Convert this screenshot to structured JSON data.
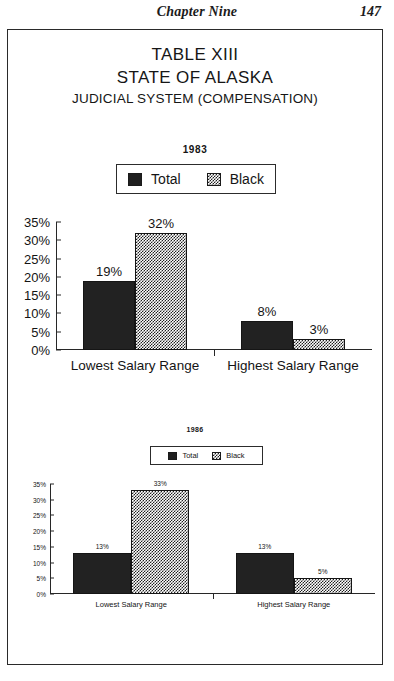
{
  "page": {
    "running_head": "Chapter Nine",
    "page_number": "147"
  },
  "table": {
    "heading_line1": "TABLE XIII",
    "heading_line2": "STATE OF ALASKA",
    "heading_line3": "JUDICIAL SYSTEM (COMPENSATION)"
  },
  "legend": {
    "total_label": "Total",
    "black_label": "Black",
    "total_swatch": "solid-black-swatch-icon",
    "black_swatch": "checkered-pattern-swatch-icon"
  },
  "colors": {
    "total_fill": "#222222",
    "black_fill": "#1f1f1f",
    "axis": "#272727",
    "frame": "#2a2a2a",
    "background": "#ffffff"
  },
  "chart_data": [
    {
      "type": "bar",
      "title": "1983",
      "xlabel": "",
      "ylabel": "",
      "ylim": [
        0,
        35
      ],
      "grid": false,
      "legend_position": "top-center",
      "categories": [
        "Lowest Salary Range",
        "Highest Salary Range"
      ],
      "ticks": [
        "0%",
        "5%",
        "10%",
        "15%",
        "20%",
        "25%",
        "30%",
        "35%"
      ],
      "tick_values": [
        0,
        5,
        10,
        15,
        20,
        25,
        30,
        35
      ],
      "series": [
        {
          "name": "Total",
          "values": [
            19,
            8
          ],
          "labels": [
            "19%",
            "8%"
          ]
        },
        {
          "name": "Black",
          "values": [
            32,
            3
          ],
          "labels": [
            "32%",
            "3%"
          ]
        }
      ]
    },
    {
      "type": "bar",
      "title": "1986",
      "xlabel": "",
      "ylabel": "",
      "ylim": [
        0,
        35
      ],
      "grid": false,
      "legend_position": "top-center",
      "categories": [
        "Lowest Salary Range",
        "Highest Salary Range"
      ],
      "ticks": [
        "0%",
        "5%",
        "10%",
        "15%",
        "20%",
        "25%",
        "30%",
        "35%"
      ],
      "tick_values": [
        0,
        5,
        10,
        15,
        20,
        25,
        30,
        35
      ],
      "series": [
        {
          "name": "Total",
          "values": [
            13,
            13
          ],
          "labels": [
            "13%",
            "13%"
          ]
        },
        {
          "name": "Black",
          "values": [
            33,
            5
          ],
          "labels": [
            "33%",
            "5%"
          ]
        }
      ]
    }
  ]
}
